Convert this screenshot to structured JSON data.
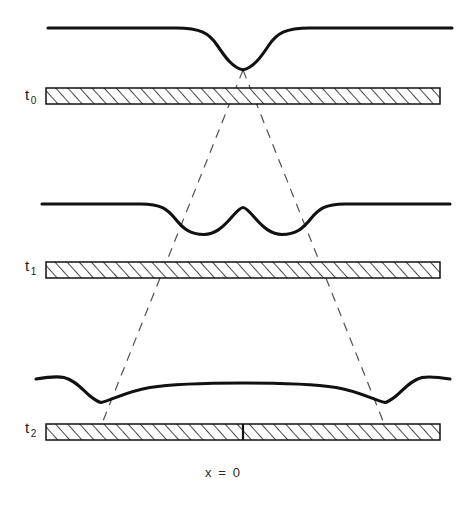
{
  "figure": {
    "domain": "diagram",
    "background_color": "#ffffff",
    "ink_color": "#111111",
    "dashed_color": "#555555",
    "width": 472,
    "height": 507
  },
  "axis": {
    "origin_label": "x = 0",
    "origin_x": 243
  },
  "rows": [
    {
      "id": "t0",
      "label_main": "t",
      "label_sub": "0",
      "bar": {
        "x": 46,
        "y": 88,
        "width": 394,
        "height": 16,
        "hatch": "forward-diagonal"
      },
      "curve_name": "waveform-t0",
      "curve_description": "flat line with single centered downward dip reaching a cusp"
    },
    {
      "id": "t1",
      "label_main": "t",
      "label_sub": "1",
      "bar": {
        "x": 46,
        "y": 262,
        "width": 394,
        "height": 16,
        "hatch": "forward-diagonal"
      },
      "curve_name": "waveform-t1",
      "curve_description": "flat line with two separated downward dips and a central rounded bump"
    },
    {
      "id": "t2",
      "label_main": "t",
      "label_sub": "2",
      "bar": {
        "x": 46,
        "y": 424,
        "width": 394,
        "height": 16,
        "hatch": "forward-diagonal",
        "tick_x": 243
      },
      "curve_name": "waveform-t2",
      "curve_description": "broad flat plateau with two far-separated downward dips near the edges and small outer bumps"
    }
  ],
  "characteristics": {
    "name": "dashed-characteristic-lines",
    "apex": {
      "x": 243,
      "y": 70
    },
    "left_end": {
      "x": 101,
      "y": 424
    },
    "right_end": {
      "x": 385,
      "y": 424
    },
    "style": "dashed",
    "count": 2
  },
  "curve_paths": {
    "t0": "M 48 28 L 175 28 C 200 28 208 33 216 44 C 224 56 232 68 243 69.5 C 254 68 262 56 270 44 C 278 33 286 28 311 28 L 452 28",
    "t1": "M 42 204 L 140 204 C 160 204 166 209 174 218 C 182 228 189 234 203 234 C 214 234 222 227 230 218 C 236 211 240 207 243 207 C 246 207 250 211 256 218 C 264 227 272 234 283 234 C 297 234 304 228 312 218 C 320 209 326 204 346 204 L 450 204"
  },
  "colors": {
    "line": "#111111",
    "dashed": "#555555",
    "hatch": "#1a1a1a",
    "bar_fill": "#ffffff",
    "text": "#1b1b1b"
  }
}
